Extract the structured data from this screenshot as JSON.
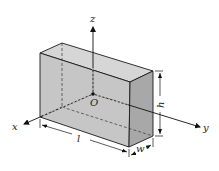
{
  "diagram": {
    "type": "3d-box-with-axes",
    "axes": {
      "x": {
        "label": "x"
      },
      "y": {
        "label": "y"
      },
      "z": {
        "label": "z"
      }
    },
    "origin": {
      "label": "O"
    },
    "dimensions": {
      "length": "l",
      "width": "w",
      "height": "h"
    },
    "colors": {
      "front_face": "#c8c8c8",
      "top_face": "#d6d6d6",
      "side_face": "#a9a9a9",
      "edges": "#1a1a1a",
      "background": "#ffffff"
    }
  }
}
